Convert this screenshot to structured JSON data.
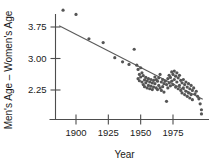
{
  "chart_data": {
    "type": "scatter",
    "title": "",
    "xlabel": "Year",
    "ylabel": "Men's Age – Women's Age",
    "xlim": [
      1885,
      2000
    ],
    "ylim": [
      1.55,
      4.35
    ],
    "xticks": [
      1900,
      1925,
      1950,
      1975
    ],
    "xtick_labels": [
      "1900",
      "1925",
      "1950",
      "1975"
    ],
    "yticks": [
      2.25,
      3.0,
      3.75
    ],
    "ytick_labels": [
      "2.25",
      "3.00",
      "3.75"
    ],
    "grid": false,
    "legend": null,
    "trendline": {
      "label": "least-squares fit",
      "x_start": 1887,
      "y_start": 3.78,
      "x_end": 1998,
      "y_end": 2.03
    },
    "points": [
      [
        1890,
        4.15
      ],
      [
        1900,
        4.05
      ],
      [
        1910,
        3.47
      ],
      [
        1921,
        3.38
      ],
      [
        1930,
        3.02
      ],
      [
        1936,
        2.92
      ],
      [
        1941,
        2.86
      ],
      [
        1945,
        3.22
      ],
      [
        1947,
        2.84
      ],
      [
        1948,
        2.74
      ],
      [
        1948,
        2.52
      ],
      [
        1949,
        2.62
      ],
      [
        1949,
        2.47
      ],
      [
        1950,
        2.78
      ],
      [
        1950,
        2.56
      ],
      [
        1951,
        2.66
      ],
      [
        1951,
        2.44
      ],
      [
        1952,
        2.59
      ],
      [
        1952,
        2.38
      ],
      [
        1953,
        2.49
      ],
      [
        1953,
        2.33
      ],
      [
        1954,
        2.55
      ],
      [
        1954,
        2.42
      ],
      [
        1955,
        2.47
      ],
      [
        1955,
        2.3
      ],
      [
        1956,
        2.52
      ],
      [
        1956,
        2.36
      ],
      [
        1957,
        2.44
      ],
      [
        1957,
        2.28
      ],
      [
        1958,
        2.5
      ],
      [
        1958,
        2.34
      ],
      [
        1959,
        2.42
      ],
      [
        1959,
        2.26
      ],
      [
        1960,
        2.48
      ],
      [
        1960,
        2.32
      ],
      [
        1961,
        2.56
      ],
      [
        1961,
        2.4
      ],
      [
        1962,
        2.5
      ],
      [
        1962,
        2.3
      ],
      [
        1963,
        2.46
      ],
      [
        1963,
        2.26
      ],
      [
        1964,
        2.54
      ],
      [
        1964,
        2.36
      ],
      [
        1965,
        2.62
      ],
      [
        1965,
        2.3
      ],
      [
        1966,
        2.44
      ],
      [
        1966,
        2.24
      ],
      [
        1967,
        2.5
      ],
      [
        1967,
        2.33
      ],
      [
        1968,
        2.4
      ],
      [
        1968,
        2.2
      ],
      [
        1969,
        2.46
      ],
      [
        1970,
        2.38
      ],
      [
        1970,
        1.98
      ],
      [
        1971,
        2.52
      ],
      [
        1971,
        2.3
      ],
      [
        1972,
        2.6
      ],
      [
        1972,
        2.42
      ],
      [
        1973,
        2.55
      ],
      [
        1973,
        2.35
      ],
      [
        1974,
        2.68
      ],
      [
        1974,
        2.46
      ],
      [
        1975,
        2.62
      ],
      [
        1975,
        2.38
      ],
      [
        1976,
        2.7
      ],
      [
        1976,
        2.5
      ],
      [
        1977,
        2.58
      ],
      [
        1977,
        2.32
      ],
      [
        1978,
        2.66
      ],
      [
        1978,
        2.44
      ],
      [
        1979,
        2.54
      ],
      [
        1979,
        2.28
      ],
      [
        1980,
        2.6
      ],
      [
        1980,
        2.36
      ],
      [
        1981,
        2.48
      ],
      [
        1981,
        2.24
      ],
      [
        1982,
        2.42
      ],
      [
        1982,
        2.18
      ],
      [
        1983,
        2.5
      ],
      [
        1983,
        2.3
      ],
      [
        1984,
        2.38
      ],
      [
        1984,
        2.14
      ],
      [
        1985,
        2.44
      ],
      [
        1985,
        2.22
      ],
      [
        1986,
        2.32
      ],
      [
        1986,
        2.1
      ],
      [
        1987,
        2.4
      ],
      [
        1987,
        2.18
      ],
      [
        1988,
        2.28
      ],
      [
        1988,
        2.06
      ],
      [
        1989,
        2.36
      ],
      [
        1989,
        2.14
      ],
      [
        1990,
        2.24
      ],
      [
        1990,
        2.02
      ],
      [
        1991,
        2.3
      ],
      [
        1992,
        2.16
      ],
      [
        1993,
        2.22
      ],
      [
        1994,
        2.1
      ],
      [
        1995,
        2.04
      ],
      [
        1996,
        1.92
      ],
      [
        1997,
        1.78
      ],
      [
        1997,
        1.68
      ]
    ]
  }
}
